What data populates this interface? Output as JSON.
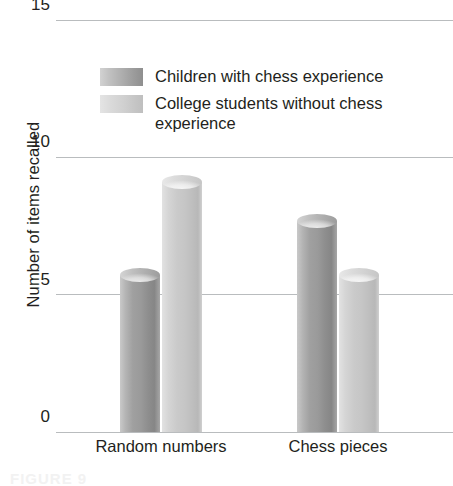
{
  "chart_data": {
    "type": "bar",
    "title": "",
    "subtitle": "",
    "xlabel": "",
    "ylabel": "Number of items recalled",
    "categories": [
      "Random numbers",
      "Chess pieces"
    ],
    "series": [
      {
        "name": "Children with chess experience",
        "color": "#9a9a9a",
        "values": [
          5.7,
          7.7
        ]
      },
      {
        "name": "College students without chess experience",
        "color": "#c6c6c6",
        "values": [
          9.1,
          5.7
        ]
      }
    ],
    "ylim": [
      0,
      15
    ],
    "yticks": [
      0,
      5,
      10,
      15
    ],
    "ytick_labels": [
      "0",
      "5",
      "10",
      "15"
    ],
    "grid": true,
    "legend_position": "top-center",
    "bar_style": "3d-cylinder"
  },
  "axis": {
    "y_title": "Number of items recalled",
    "ticks": [
      {
        "label": "15",
        "value": 15
      },
      {
        "label": "10",
        "value": 10
      },
      {
        "label": "5",
        "value": 5
      },
      {
        "label": "0",
        "value": 0
      }
    ]
  },
  "legend": {
    "items": [
      {
        "label": "Children with chess experience",
        "swatch": "sw-a"
      },
      {
        "label": "College students without chess experience",
        "swatch": "sw-b"
      }
    ]
  },
  "x_labels": [
    {
      "label": "Random numbers"
    },
    {
      "label": "Chess pieces"
    }
  ],
  "caption": {
    "text": "FIGURE 9"
  },
  "colors": {
    "grid": "#b9bcbe",
    "text": "#231f20",
    "series_a": "#9a9a9a",
    "series_b": "#c6c6c6",
    "background": "#ffffff"
  }
}
